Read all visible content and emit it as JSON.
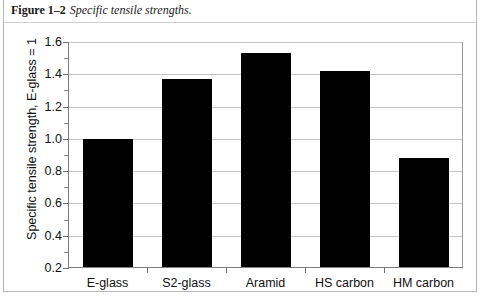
{
  "caption": {
    "label": "Figure 1–2",
    "title": "Specific tensile strengths."
  },
  "chart_data": {
    "type": "bar",
    "title": "Specific tensile strengths.",
    "categories": [
      "E-glass",
      "S2-glass",
      "Aramid",
      "HS carbon",
      "HM carbon"
    ],
    "values": [
      1.0,
      1.37,
      1.53,
      1.42,
      0.88
    ],
    "xlabel": "",
    "ylabel": "Specific tensile strength, E-glass = 1",
    "ylim": [
      0.2,
      1.6
    ],
    "ytick_labels": [
      "1.6",
      "1.4",
      "1.2",
      "1.0",
      "0.8",
      "0.6",
      "0.4",
      "0.2"
    ],
    "ytick_values": [
      1.6,
      1.4,
      1.2,
      1.0,
      0.8,
      0.6,
      0.4,
      0.2
    ],
    "yminor_values": [
      1.5,
      1.3,
      1.1,
      0.9,
      0.7,
      0.5,
      0.3
    ],
    "grid": true,
    "legend": null,
    "bar_color": "#000000",
    "grid_color": "#c4c4c4"
  }
}
